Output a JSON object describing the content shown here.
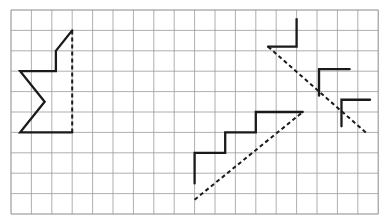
{
  "figure": {
    "background_color": "#ffffff",
    "grid": {
      "name": "square-grid",
      "origin_x": 11,
      "origin_y": 10,
      "cell_size": 20.4,
      "columns": 18,
      "rows": 10,
      "line_color": "#9a9a9a",
      "line_width": 0.8,
      "border_color": "#8a8a8a"
    },
    "stroke_color": "#1a1a1a",
    "stroke_width": 2.3,
    "dash_color": "#1a1a1a",
    "dash_width": 2.0,
    "dash_pattern": "4,3"
  },
  "chart_data": {
    "type": "diagram",
    "coordinate_system": {
      "note": "Coordinates are given in grid-cell units, measured from the grid's top-left corner. x increases to the right, y increases downward.",
      "columns": 18,
      "rows": 10
    },
    "shapes": [
      {
        "name": "left-half-star",
        "label": "Half star outline (left figure)",
        "kind": "polyline",
        "stroke": "solid",
        "points_cells": [
          [
            3.0,
            1.0
          ],
          [
            2.2,
            2.0
          ],
          [
            2.2,
            3.0
          ],
          [
            0.45,
            3.0
          ],
          [
            1.65,
            4.5
          ],
          [
            0.45,
            6.0
          ],
          [
            3.0,
            6.0
          ]
        ]
      },
      {
        "name": "left-mirror-line",
        "label": "Dashed vertical line of symmetry (left figure)",
        "kind": "line",
        "stroke": "dashed",
        "points_cells": [
          [
            3.0,
            1.0
          ],
          [
            3.0,
            6.0
          ]
        ]
      },
      {
        "name": "middle-staircase",
        "label": "Staircase outline (middle figure)",
        "kind": "polyline",
        "stroke": "solid",
        "points_cells": [
          [
            9.0,
            8.5
          ],
          [
            9.0,
            7.0
          ],
          [
            10.5,
            7.0
          ],
          [
            10.5,
            6.0
          ],
          [
            12.0,
            6.0
          ],
          [
            12.0,
            5.0
          ],
          [
            14.3,
            5.0
          ]
        ]
      },
      {
        "name": "middle-mirror-line",
        "label": "Dashed diagonal line of symmetry (middle figure)",
        "kind": "line",
        "stroke": "dashed",
        "points_cells": [
          [
            9.0,
            9.3
          ],
          [
            14.3,
            5.0
          ]
        ]
      },
      {
        "name": "right-staircase",
        "label": "Staircase outline (right figure)",
        "kind": "polyline",
        "stroke": "solid",
        "points_cells": [
          [
            12.6,
            1.8
          ],
          [
            14.0,
            1.8
          ],
          [
            14.0,
            0.4
          ],
          [
            14.0,
            1.8
          ]
        ]
      },
      {
        "name": "right-staircase-step-2",
        "label": "Second step of right figure",
        "kind": "polyline",
        "stroke": "solid",
        "points_cells": [
          [
            15.1,
            4.2
          ],
          [
            15.1,
            2.9
          ],
          [
            16.6,
            2.9
          ]
        ]
      },
      {
        "name": "right-staircase-step-3",
        "label": "Third step of right figure",
        "kind": "polyline",
        "stroke": "solid",
        "points_cells": [
          [
            16.2,
            5.7
          ],
          [
            16.2,
            4.4
          ],
          [
            17.6,
            4.4
          ]
        ]
      },
      {
        "name": "right-mirror-line",
        "label": "Dashed diagonal line of symmetry (right figure)",
        "kind": "line",
        "stroke": "dashed",
        "points_cells": [
          [
            12.6,
            1.8
          ],
          [
            17.5,
            6.1
          ]
        ]
      }
    ]
  }
}
